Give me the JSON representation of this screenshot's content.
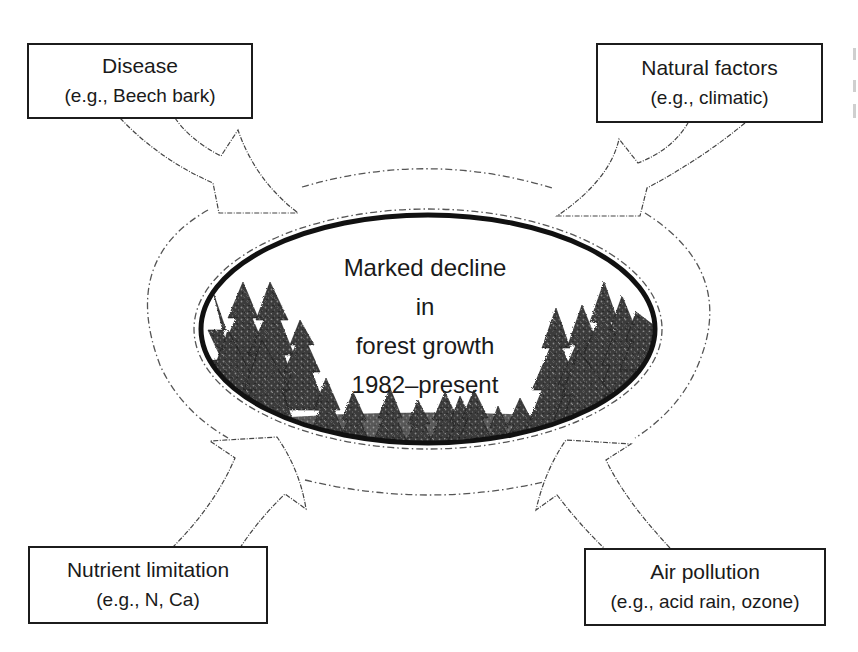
{
  "diagram": {
    "center": {
      "lines": [
        "Marked decline",
        "in",
        "forest growth",
        "1982–present"
      ]
    },
    "factors": [
      {
        "id": "disease",
        "title": "Disease",
        "example": "(e.g., Beech bark)",
        "position": "top-left",
        "arrow_direction": "toward-center"
      },
      {
        "id": "natural",
        "title": "Natural factors",
        "example": "(e.g., climatic)",
        "position": "top-right",
        "arrow_direction": "toward-center"
      },
      {
        "id": "nutrient",
        "title": "Nutrient limitation",
        "example": "(e.g., N, Ca)",
        "position": "bottom-left",
        "arrow_direction": "toward-center"
      },
      {
        "id": "air",
        "title": "Air pollution",
        "example": "(e.g., acid rain, ozone)",
        "position": "bottom-right",
        "arrow_direction": "toward-center"
      }
    ],
    "illustration": "conifer-forest-silhouette",
    "colors": {
      "stroke": "#1c1c1c",
      "dashed": "#555555",
      "tree": "#2a2a2a",
      "background": "#ffffff"
    }
  }
}
